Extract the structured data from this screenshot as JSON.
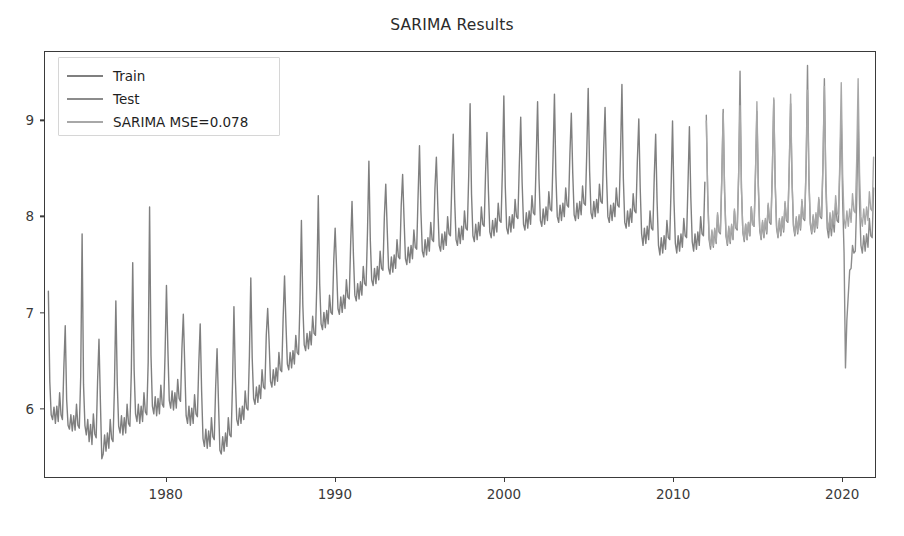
{
  "chart_data": {
    "type": "line",
    "title": "SARIMA Results",
    "xlabel": "",
    "ylabel": "",
    "xlim": [
      1972.8,
      2022.0
    ],
    "ylim": [
      5.28,
      9.72
    ],
    "xticks": [
      1980,
      1990,
      2000,
      2010,
      2020
    ],
    "xtick_labels": [
      "1980",
      "1990",
      "2000",
      "2010",
      "2020"
    ],
    "yticks": [
      6,
      7,
      8,
      9
    ],
    "ytick_labels": [
      "6",
      "7",
      "8",
      "9"
    ],
    "grid": false,
    "legend_position": "upper left",
    "colors": {
      "train": "#7f7f7f",
      "test": "#8c8c8c",
      "forecast": "#a8a8a8",
      "axis": "#3a3a3a",
      "title": "#2b2b2b",
      "background": "#ffffff"
    },
    "series": [
      {
        "name": "Train",
        "label": "Train",
        "color": "#7f7f7f",
        "x_start": 1973.0,
        "x_end": 2011.92,
        "x_step": 0.08333,
        "values": [
          7.22,
          6.28,
          5.93,
          5.88,
          6.01,
          5.84,
          6.02,
          5.86,
          6.16,
          5.93,
          5.88,
          6.42,
          6.86,
          6.09,
          5.82,
          5.78,
          5.93,
          5.76,
          5.92,
          5.77,
          6.04,
          5.82,
          5.79,
          6.33,
          7.82,
          6.25,
          5.82,
          5.72,
          5.88,
          5.65,
          5.83,
          5.62,
          5.94,
          5.73,
          5.69,
          6.28,
          6.72,
          6.07,
          5.47,
          5.52,
          5.72,
          5.55,
          5.74,
          5.58,
          5.88,
          5.68,
          5.65,
          6.22,
          7.12,
          6.26,
          5.81,
          5.74,
          5.92,
          5.72,
          5.9,
          5.74,
          6.04,
          5.84,
          5.81,
          6.38,
          7.52,
          6.4,
          5.94,
          5.86,
          6.04,
          5.84,
          6.02,
          5.86,
          6.16,
          5.96,
          5.93,
          6.48,
          8.1,
          6.55,
          6.02,
          5.94,
          6.12,
          5.92,
          6.1,
          5.94,
          6.24,
          6.04,
          6.01,
          6.56,
          7.28,
          6.62,
          6.08,
          6.0,
          6.18,
          5.98,
          6.16,
          6.0,
          6.3,
          6.1,
          6.07,
          6.62,
          6.98,
          6.45,
          5.92,
          5.84,
          6.02,
          5.82,
          6.0,
          5.84,
          6.14,
          5.94,
          5.91,
          6.46,
          6.88,
          6.18,
          5.68,
          5.6,
          5.78,
          5.58,
          5.76,
          5.6,
          5.9,
          5.7,
          5.67,
          6.22,
          6.62,
          6.06,
          5.56,
          5.52,
          5.7,
          5.55,
          5.74,
          5.6,
          5.9,
          5.72,
          5.7,
          6.26,
          7.06,
          6.32,
          5.88,
          5.82,
          6.0,
          5.84,
          6.02,
          5.88,
          6.18,
          6.0,
          5.98,
          6.54,
          7.36,
          6.52,
          6.1,
          6.04,
          6.22,
          6.06,
          6.24,
          6.1,
          6.4,
          6.22,
          6.2,
          6.76,
          7.04,
          6.7,
          6.28,
          6.22,
          6.4,
          6.24,
          6.42,
          6.28,
          6.58,
          6.4,
          6.38,
          6.94,
          7.38,
          6.88,
          6.46,
          6.4,
          6.58,
          6.42,
          6.6,
          6.46,
          6.76,
          6.58,
          6.56,
          7.12,
          7.96,
          7.08,
          6.66,
          6.6,
          6.78,
          6.62,
          6.8,
          6.66,
          6.96,
          6.78,
          6.76,
          7.32,
          8.22,
          7.3,
          6.88,
          6.82,
          7.0,
          6.84,
          7.02,
          6.88,
          7.18,
          7.0,
          6.98,
          7.54,
          7.88,
          7.46,
          7.04,
          6.98,
          7.16,
          7.0,
          7.18,
          7.04,
          7.34,
          7.16,
          7.14,
          7.7,
          8.16,
          7.6,
          7.18,
          7.12,
          7.3,
          7.14,
          7.32,
          7.18,
          7.48,
          7.3,
          7.28,
          7.84,
          8.58,
          7.76,
          7.34,
          7.28,
          7.46,
          7.3,
          7.48,
          7.34,
          7.64,
          7.46,
          7.44,
          8.0,
          8.34,
          7.88,
          7.46,
          7.4,
          7.58,
          7.42,
          7.6,
          7.46,
          7.76,
          7.58,
          7.56,
          8.12,
          8.44,
          7.98,
          7.56,
          7.5,
          7.68,
          7.52,
          7.7,
          7.56,
          7.86,
          7.68,
          7.66,
          8.22,
          8.74,
          8.06,
          7.64,
          7.58,
          7.76,
          7.6,
          7.78,
          7.64,
          7.94,
          7.76,
          7.74,
          8.3,
          8.62,
          8.12,
          7.7,
          7.64,
          7.82,
          7.66,
          7.84,
          7.7,
          8.0,
          7.82,
          7.8,
          8.36,
          8.86,
          8.18,
          7.76,
          7.7,
          7.88,
          7.72,
          7.9,
          7.76,
          8.06,
          7.88,
          7.86,
          8.42,
          9.18,
          8.24,
          7.8,
          7.74,
          7.92,
          7.76,
          7.94,
          7.8,
          8.1,
          7.92,
          7.9,
          8.46,
          8.88,
          8.28,
          7.84,
          7.78,
          7.96,
          7.8,
          7.98,
          7.84,
          8.14,
          7.96,
          7.94,
          8.5,
          9.26,
          8.32,
          7.88,
          7.82,
          8.0,
          7.84,
          8.02,
          7.88,
          8.18,
          8.0,
          7.98,
          8.54,
          9.04,
          8.36,
          7.92,
          7.86,
          8.04,
          7.88,
          8.06,
          7.92,
          8.22,
          8.04,
          8.02,
          8.58,
          9.2,
          8.4,
          7.96,
          7.9,
          8.08,
          7.92,
          8.1,
          7.96,
          8.26,
          8.08,
          8.06,
          8.62,
          9.28,
          8.44,
          8.0,
          7.94,
          8.12,
          7.96,
          8.14,
          8.0,
          8.3,
          8.12,
          8.1,
          8.66,
          9.08,
          8.46,
          8.02,
          7.96,
          8.14,
          7.98,
          8.16,
          8.02,
          8.32,
          8.14,
          8.12,
          8.68,
          9.34,
          8.48,
          8.04,
          7.98,
          8.16,
          8.0,
          8.18,
          8.04,
          8.34,
          8.16,
          8.14,
          8.7,
          9.14,
          8.44,
          8.0,
          7.94,
          8.12,
          7.96,
          8.14,
          8.0,
          8.3,
          8.12,
          8.1,
          8.66,
          9.38,
          8.4,
          7.94,
          7.88,
          8.06,
          7.9,
          8.08,
          7.94,
          8.24,
          8.06,
          8.04,
          8.6,
          9.02,
          8.3,
          7.82,
          7.7,
          7.88,
          7.72,
          7.9,
          7.76,
          8.06,
          7.88,
          7.86,
          8.42,
          8.86,
          8.16,
          7.7,
          7.6,
          7.78,
          7.62,
          7.8,
          7.66,
          7.96,
          7.78,
          7.76,
          8.32,
          9.0,
          8.18,
          7.72,
          7.62,
          7.8,
          7.64,
          7.82,
          7.68,
          7.98,
          7.8,
          7.78,
          8.34,
          8.94,
          8.2,
          7.74,
          7.64,
          7.82,
          7.66,
          7.84,
          7.7,
          8.0,
          7.82,
          7.8,
          8.36
        ]
      },
      {
        "name": "Test",
        "label": "Test",
        "color": "#8c8c8c",
        "x_start": 2012.0,
        "x_end": 2021.92,
        "x_step": 0.08333,
        "values": [
          9.06,
          8.22,
          7.76,
          7.66,
          7.84,
          7.68,
          7.86,
          7.72,
          8.02,
          7.84,
          7.82,
          8.38,
          9.12,
          8.26,
          7.8,
          7.7,
          7.88,
          7.72,
          7.9,
          7.76,
          8.06,
          7.88,
          7.86,
          8.42,
          9.52,
          8.3,
          7.84,
          7.74,
          7.92,
          7.76,
          7.94,
          7.8,
          8.1,
          7.92,
          7.9,
          8.46,
          9.1,
          8.32,
          7.86,
          7.76,
          7.94,
          7.78,
          7.96,
          7.82,
          8.12,
          7.94,
          7.92,
          8.48,
          9.22,
          8.34,
          7.88,
          7.78,
          7.96,
          7.8,
          7.98,
          7.84,
          8.14,
          7.96,
          7.94,
          8.5,
          9.18,
          8.36,
          7.9,
          7.8,
          7.98,
          7.82,
          8.0,
          7.86,
          8.16,
          7.98,
          7.96,
          8.52,
          9.58,
          8.38,
          7.92,
          7.82,
          8.0,
          7.84,
          8.02,
          7.88,
          8.18,
          8.0,
          7.98,
          8.54,
          9.44,
          8.34,
          7.88,
          7.78,
          7.96,
          7.8,
          7.98,
          7.84,
          8.14,
          7.96,
          7.94,
          8.5,
          9.06,
          8.16,
          7.62,
          6.42,
          6.92,
          7.18,
          7.44,
          7.46,
          7.7,
          7.62,
          7.64,
          8.18,
          9.02,
          8.14,
          7.7,
          7.62,
          7.8,
          7.64,
          7.82,
          7.68,
          7.98,
          7.8,
          7.78,
          8.3
        ]
      },
      {
        "name": "SARIMA MSE=0.078",
        "label": "SARIMA MSE=0.078",
        "color": "#a8a8a8",
        "x_start": 2012.0,
        "x_end": 2021.92,
        "x_step": 0.08333,
        "values": [
          9.0,
          8.24,
          7.78,
          7.7,
          7.86,
          7.7,
          7.88,
          7.74,
          8.04,
          7.86,
          7.84,
          8.4,
          9.08,
          8.28,
          7.82,
          7.72,
          7.9,
          7.74,
          7.92,
          7.78,
          8.08,
          7.9,
          7.88,
          8.44,
          9.16,
          8.3,
          7.84,
          7.76,
          7.92,
          7.76,
          7.94,
          7.8,
          8.1,
          7.92,
          7.9,
          8.46,
          9.2,
          8.34,
          7.88,
          7.78,
          7.96,
          7.8,
          7.98,
          7.84,
          8.14,
          7.96,
          7.94,
          8.5,
          9.24,
          8.36,
          7.9,
          7.8,
          7.98,
          7.82,
          8.0,
          7.86,
          8.16,
          7.98,
          7.96,
          8.52,
          9.28,
          8.38,
          7.92,
          7.82,
          8.0,
          7.84,
          8.02,
          7.88,
          8.18,
          8.0,
          7.98,
          8.54,
          9.32,
          8.4,
          7.94,
          7.84,
          8.02,
          7.86,
          8.04,
          7.9,
          8.2,
          8.02,
          8.0,
          8.56,
          9.36,
          8.42,
          7.96,
          7.86,
          8.04,
          7.88,
          8.06,
          7.92,
          8.22,
          8.04,
          8.02,
          8.58,
          9.4,
          8.44,
          7.98,
          7.88,
          8.06,
          7.9,
          8.08,
          7.94,
          8.24,
          8.06,
          8.04,
          8.6,
          9.44,
          8.46,
          8.0,
          7.9,
          8.08,
          7.92,
          8.1,
          7.96,
          8.26,
          8.08,
          8.06,
          8.62
        ]
      }
    ]
  },
  "legend": {
    "entries": [
      {
        "label": "Train"
      },
      {
        "label": "Test"
      },
      {
        "label": "SARIMA MSE=0.078"
      }
    ]
  }
}
